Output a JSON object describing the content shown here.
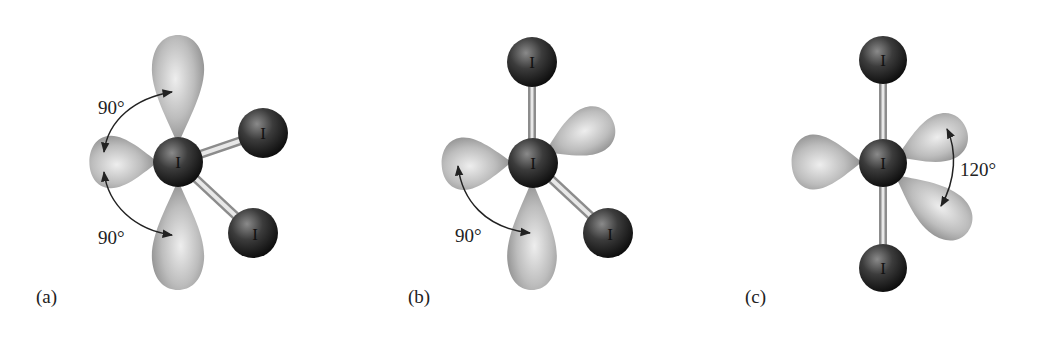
{
  "figure": {
    "panels": [
      {
        "id": "a",
        "label": "(a)",
        "central_atom": "I",
        "terminal_atoms": [
          "I",
          "I"
        ],
        "angle_labels": [
          "90°",
          "90°"
        ],
        "lone_pairs": 3
      },
      {
        "id": "b",
        "label": "(b)",
        "central_atom": "I",
        "terminal_atoms": [
          "I",
          "I"
        ],
        "angle_labels": [
          "90°"
        ],
        "lone_pairs": 3
      },
      {
        "id": "c",
        "label": "(c)",
        "central_atom": "I",
        "terminal_atoms": [
          "I",
          "I"
        ],
        "angle_labels": [
          "120°"
        ],
        "lone_pairs": 3
      }
    ],
    "colors": {
      "lobe_light": "#e6e6e6",
      "lobe_dark": "#8a8a8a",
      "atom_light": "#7a7a7a",
      "atom_dark": "#151515",
      "bond": "#d0d0d0",
      "arrow": "#222222"
    }
  }
}
